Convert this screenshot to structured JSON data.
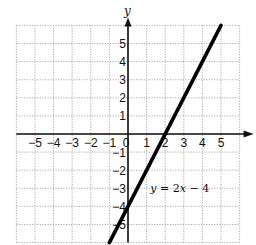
{
  "chart_data": {
    "type": "line",
    "title": "",
    "xlabel": "x",
    "ylabel": "y",
    "xlim": [
      -6,
      6
    ],
    "ylim": [
      -6,
      6
    ],
    "grid": true,
    "x_ticks": [
      -5,
      -4,
      -3,
      -2,
      -1,
      0,
      1,
      2,
      3,
      4,
      5
    ],
    "y_ticks": [
      -5,
      -4,
      -3,
      -2,
      -1,
      1,
      2,
      3,
      4,
      5
    ],
    "x_tick_labels": [
      "−5",
      "−4",
      "−3",
      "−2",
      "−1",
      "0",
      "1",
      "2",
      "3",
      "4",
      "5"
    ],
    "y_tick_labels": [
      "−5",
      "−4",
      "−3",
      "−2",
      "−1",
      "1",
      "2",
      "3",
      "4",
      "5"
    ],
    "series": [
      {
        "name": "y = 2x − 4",
        "equation": {
          "slope": 2,
          "intercept": -4
        },
        "x": [
          -1,
          0,
          1,
          2,
          3,
          5
        ],
        "y": [
          -6,
          -4,
          -2,
          0,
          2,
          6
        ]
      }
    ],
    "annotations": [
      {
        "text": "y = 2x − 4",
        "x": 1.2,
        "y": -3.0
      }
    ]
  },
  "labels": {
    "x_axis": "x",
    "y_axis": "y",
    "equation": "y = 2x − 4"
  }
}
